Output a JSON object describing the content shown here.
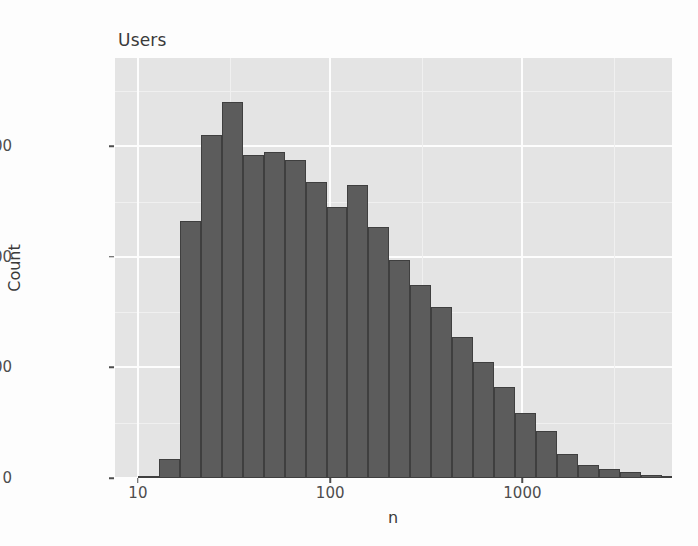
{
  "figure": {
    "title": "Users",
    "panel_bg": "#e4e4e4",
    "grid_color": "#fdfdfd",
    "bar_fill": "#5c5c5c",
    "bar_stroke": "#3f3f3f",
    "text_color": "#4d4d4d"
  },
  "axes": {
    "y_label": "Count",
    "x_label": "n",
    "y_ticks": [
      {
        "label": "0",
        "value": 0
      },
      {
        "label": "2000",
        "value": 2000
      },
      {
        "label": "4000",
        "value": 4000
      },
      {
        "label": "6000",
        "value": 6000
      }
    ],
    "x_ticks": [
      {
        "label": "10",
        "value": 10
      },
      {
        "label": "100",
        "value": 100
      },
      {
        "label": "1000",
        "value": 1000
      }
    ]
  },
  "chart_data": {
    "type": "bar",
    "title": "Users",
    "xlabel": "n",
    "ylabel": "Count",
    "xscale": "log10",
    "yscale": "linear",
    "xlim": [
      7.6,
      6000
    ],
    "ylim": [
      0,
      7600
    ],
    "grid": true,
    "legend": "none",
    "bin_width_log10": 0.109,
    "series": [
      {
        "name": "Users",
        "bins": [
          {
            "x_left": 10.0,
            "x_right": 12.9,
            "count": 30
          },
          {
            "x_left": 12.9,
            "x_right": 16.5,
            "count": 350
          },
          {
            "x_left": 16.5,
            "x_right": 21.3,
            "count": 4650
          },
          {
            "x_left": 21.3,
            "x_right": 27.3,
            "count": 6200
          },
          {
            "x_left": 27.3,
            "x_right": 35.1,
            "count": 6800
          },
          {
            "x_left": 35.1,
            "x_right": 45.1,
            "count": 5850
          },
          {
            "x_left": 45.1,
            "x_right": 58.0,
            "count": 5900
          },
          {
            "x_left": 58.0,
            "x_right": 74.5,
            "count": 5750
          },
          {
            "x_left": 74.5,
            "x_right": 95.8,
            "count": 5350
          },
          {
            "x_left": 95.8,
            "x_right": 123.0,
            "count": 4900
          },
          {
            "x_left": 123.0,
            "x_right": 158.1,
            "count": 5300
          },
          {
            "x_left": 158.1,
            "x_right": 203.2,
            "count": 4550
          },
          {
            "x_left": 203.2,
            "x_right": 261.2,
            "count": 3950
          },
          {
            "x_left": 261.2,
            "x_right": 335.7,
            "count": 3500
          },
          {
            "x_left": 335.7,
            "x_right": 431.4,
            "count": 3100
          },
          {
            "x_left": 431.4,
            "x_right": 554.5,
            "count": 2550
          },
          {
            "x_left": 554.5,
            "x_right": 712.7,
            "count": 2100
          },
          {
            "x_left": 712.7,
            "x_right": 916.0,
            "count": 1650
          },
          {
            "x_left": 916.0,
            "x_right": 1177.3,
            "count": 1180
          },
          {
            "x_left": 1177.3,
            "x_right": 1513.1,
            "count": 850
          },
          {
            "x_left": 1513.1,
            "x_right": 1944.7,
            "count": 430
          },
          {
            "x_left": 1944.7,
            "x_right": 2499.4,
            "count": 240
          },
          {
            "x_left": 2499.4,
            "x_right": 3212.5,
            "count": 160
          },
          {
            "x_left": 3212.5,
            "x_right": 4128.8,
            "count": 110
          },
          {
            "x_left": 4128.8,
            "x_right": 5306.6,
            "count": 60
          },
          {
            "x_left": 5306.6,
            "x_right": 6820.8,
            "count": 30
          },
          {
            "x_left": 6820.8,
            "x_right": 8766.5,
            "count": 15
          },
          {
            "x_left": 8766.5,
            "x_right": 11267.6,
            "count": 5
          }
        ]
      }
    ]
  }
}
